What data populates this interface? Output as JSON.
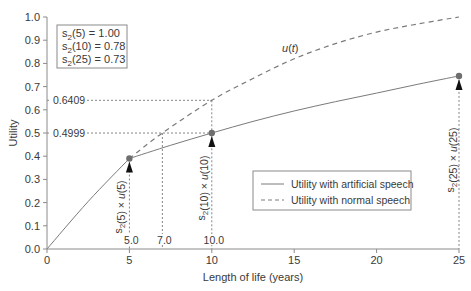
{
  "chart_data": {
    "type": "line",
    "title": "",
    "xlabel": "Length of life (years)",
    "ylabel": "Utility",
    "xlim": [
      0,
      25
    ],
    "ylim": [
      0,
      1.0
    ],
    "grid": false,
    "xticks": [
      0,
      5,
      10,
      15,
      20,
      25
    ],
    "xtick_labels": [
      "0",
      "5",
      "10",
      "15",
      "20",
      "25"
    ],
    "yticks": [
      0.0,
      0.1,
      0.2,
      0.3,
      0.4,
      0.5,
      0.6,
      0.7,
      0.8,
      0.9,
      1.0
    ],
    "ytick_labels": [
      "0.0",
      "0.1",
      "0.2",
      "0.3",
      "0.4",
      "0.5",
      "0.6",
      "0.7",
      "0.8",
      "0.9",
      "1.0"
    ],
    "series": [
      {
        "name": "Utility with artificial speech",
        "style": "solid",
        "break_at_x": 5,
        "x": [
          0,
          2.5,
          5,
          7.5,
          10,
          12.5,
          15,
          17.5,
          20,
          22.5,
          25
        ],
        "y": [
          0,
          0.205,
          0.39,
          0.447,
          0.4999,
          0.55,
          0.595,
          0.635,
          0.672,
          0.71,
          0.746
        ]
      },
      {
        "name": "Utility with normal speech",
        "style": "dashed",
        "curve_label": "u(t)",
        "visible_from_x": 5,
        "x": [
          0,
          2.5,
          5,
          7,
          10,
          12.5,
          15,
          17.5,
          20,
          22.5,
          25
        ],
        "y": [
          0,
          0.205,
          0.39,
          0.5,
          0.6409,
          0.735,
          0.82,
          0.885,
          0.935,
          0.97,
          1.0
        ]
      }
    ],
    "points": [
      {
        "x": 5,
        "y": 0.39,
        "label_s": "s",
        "label_sub": "2",
        "label_arg": "(5)",
        "label_u": "u",
        "label_uarg": "(5)"
      },
      {
        "x": 10,
        "y": 0.4999,
        "label_s": "s",
        "label_sub": "2",
        "label_arg": "(10)",
        "label_u": "u",
        "label_uarg": "(10)"
      },
      {
        "x": 25,
        "y": 0.746,
        "label_s": "s",
        "label_sub": "2",
        "label_arg": "(25)",
        "label_u": "u",
        "label_uarg": "(25)"
      }
    ],
    "reference_lines": {
      "horizontal": [
        {
          "y": 0.6409,
          "x_end": 10,
          "label": "0.6409"
        },
        {
          "y": 0.4999,
          "x_end": 10,
          "label": "0.4999"
        }
      ],
      "vertical": [
        {
          "x": 5,
          "y_top": 0.39,
          "label": "5.0"
        },
        {
          "x": 7,
          "y_top": 0.4999,
          "label": "7.0"
        },
        {
          "x": 10,
          "y_top": 0.6409,
          "label": "10.0"
        },
        {
          "x": 25,
          "y_top": 0.746,
          "label": ""
        }
      ]
    },
    "annotation_box": [
      {
        "s": "s",
        "sub": "2",
        "arg": "(5)",
        "eq": "   = 1.00"
      },
      {
        "s": "s",
        "sub": "2",
        "arg": "(10)",
        "eq": " = 0.78"
      },
      {
        "s": "s",
        "sub": "2",
        "arg": "(25)",
        "eq": " = 0.73"
      }
    ],
    "legend": {
      "position": "lower-right-inside",
      "entries": [
        {
          "label": "Utility with artificial speech",
          "style": "solid"
        },
        {
          "label": "Utility with normal speech",
          "style": "dashed"
        }
      ]
    },
    "colors": {
      "line": "#7a7a7a",
      "axis": "#8a8a8a",
      "text": "#3a3a3a",
      "marker": "#6e6e6e",
      "arrow": "#111111"
    }
  },
  "labels": {
    "xlabel": "Length of life (years)",
    "ylabel": "Utility",
    "curve_u": "u",
    "curve_t": "t",
    "legend_solid": "Utility with artificial speech",
    "legend_dashed": "Utility with normal speech"
  }
}
